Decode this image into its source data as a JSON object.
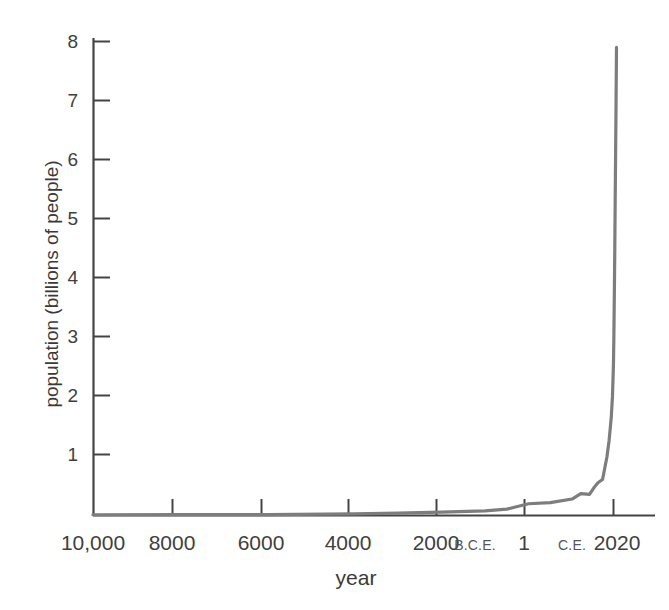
{
  "chart_data": {
    "type": "line",
    "title": "",
    "subtitle": "",
    "xlabel": "year",
    "ylabel": "population (billions of people)",
    "grid": false,
    "legend": "none",
    "line_color": "#7d7d7d",
    "axis_color": "#444444",
    "background": "#ffffff",
    "xlim": [
      -10000,
      2020
    ],
    "ylim": [
      0,
      8
    ],
    "y_ticks": [
      1,
      2,
      3,
      4,
      5,
      6,
      7,
      8
    ],
    "y_tick_labels": [
      "1",
      "2",
      "3",
      "4",
      "5",
      "6",
      "7",
      "8"
    ],
    "x_ticks": [
      -10000,
      -8000,
      -6000,
      -4000,
      -2000,
      1,
      2020
    ],
    "x_tick_labels": [
      "10,000",
      "8000",
      "6000",
      "4000",
      "2000",
      "1",
      "2020"
    ],
    "x_era_labels": [
      "B.C.E.",
      "C.E."
    ],
    "annotations": [
      "B.C.E.",
      "C.E."
    ],
    "series": [
      {
        "name": "world population",
        "x": [
          -10000,
          -8000,
          -6000,
          -4000,
          -3000,
          -2000,
          -1000,
          -500,
          1,
          500,
          1000,
          1200,
          1400,
          1500,
          1600,
          1700,
          1750,
          1800,
          1850,
          1900,
          1927,
          1950,
          1960,
          1970,
          1980,
          1990,
          2000,
          2010,
          2020
        ],
        "values": [
          0.004,
          0.005,
          0.007,
          0.02,
          0.03,
          0.05,
          0.07,
          0.1,
          0.19,
          0.21,
          0.27,
          0.36,
          0.35,
          0.46,
          0.55,
          0.6,
          0.79,
          0.98,
          1.26,
          1.65,
          2.0,
          2.54,
          3.03,
          3.7,
          4.44,
          5.32,
          6.14,
          6.96,
          7.9
        ]
      }
    ]
  },
  "axis": {
    "y_labels": [
      {
        "value": "8",
        "y": 41
      },
      {
        "value": "7",
        "y": 100
      },
      {
        "value": "6",
        "y": 159
      },
      {
        "value": "5",
        "y": 218
      },
      {
        "value": "4",
        "y": 277
      },
      {
        "value": "3",
        "y": 336
      },
      {
        "value": "2",
        "y": 395
      },
      {
        "value": "1",
        "y": 454
      }
    ],
    "x_labels": [
      {
        "value": "10,000",
        "x": 93
      },
      {
        "value": "8000",
        "x": 172
      },
      {
        "value": "6000",
        "x": 261
      },
      {
        "value": "4000",
        "x": 348
      },
      {
        "value": "2000",
        "x": 436
      },
      {
        "value": "B.C.E.",
        "x": 475
      },
      {
        "value": "1",
        "x": 524
      },
      {
        "value": "C.E.",
        "x": 572
      },
      {
        "value": "2020",
        "x": 617
      }
    ]
  },
  "titles": {
    "x_axis": "year",
    "y_axis": "population (billions of people)"
  }
}
